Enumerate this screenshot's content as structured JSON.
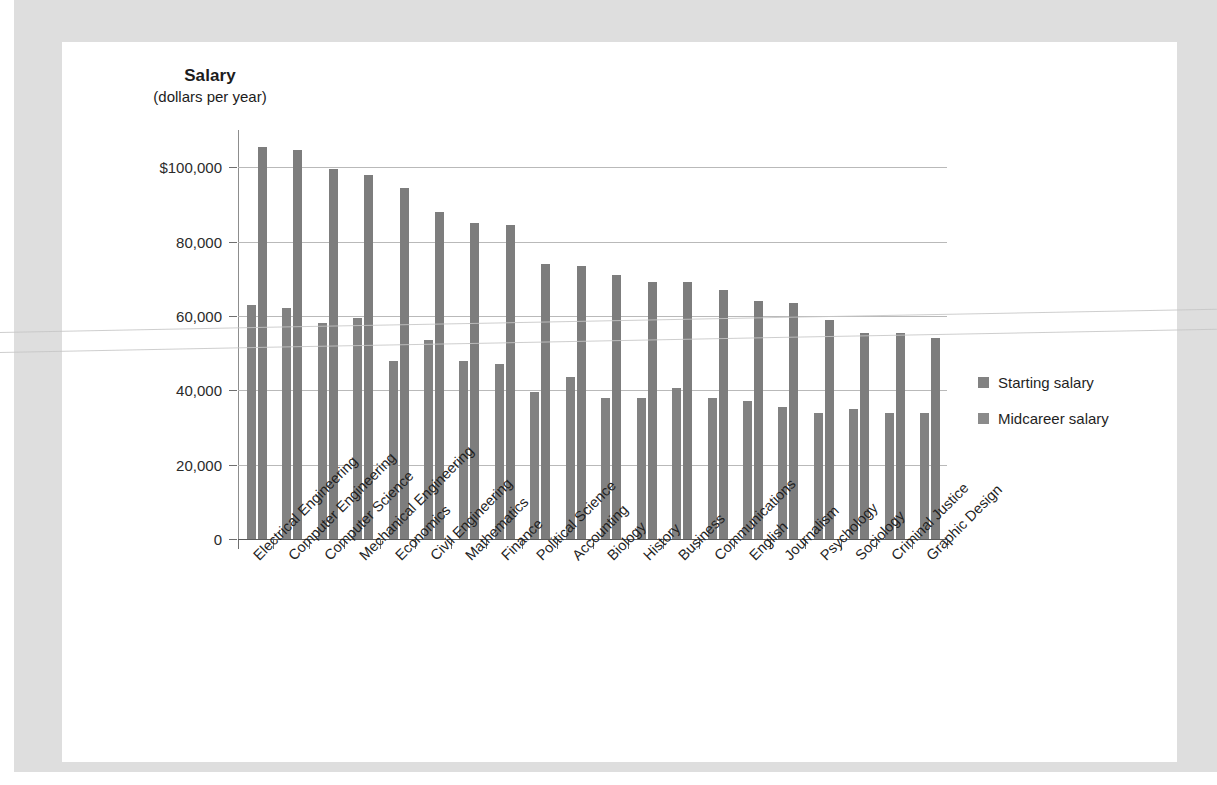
{
  "chart_data": {
    "type": "bar",
    "title": "Salary",
    "subtitle": "(dollars per year)",
    "xlabel": "",
    "ylabel": "Salary (dollars per year)",
    "ylim": [
      0,
      110000
    ],
    "grid": true,
    "legend_position": "right",
    "ytick_labels": [
      "$100,000",
      "80,000",
      "60,000",
      "40,000",
      "20,000",
      "0"
    ],
    "ytick_values": [
      100000,
      80000,
      60000,
      40000,
      20000,
      0
    ],
    "categories": [
      "Electrical Engineering",
      "Computer Engineering",
      "Computer Science",
      "Mechanical Engineering",
      "Economics",
      "Civil Engineering",
      "Mathematics",
      "Finance",
      "Political Science",
      "Accounting",
      "Biology",
      "History",
      "Business",
      "Communications",
      "English",
      "Journalism",
      "Psychology",
      "Sociology",
      "Criminal Justice",
      "Graphic Design"
    ],
    "series": [
      {
        "name": "Starting salary",
        "color": "#828282",
        "values": [
          63000,
          62000,
          58000,
          59500,
          48000,
          53500,
          48000,
          47000,
          39500,
          43500,
          38000,
          38000,
          40500,
          38000,
          37000,
          35500,
          34000,
          35000,
          34000,
          34000
        ]
      },
      {
        "name": "Midcareer salary",
        "color": "#7d7d7d",
        "values": [
          105500,
          104500,
          99500,
          98000,
          94500,
          88000,
          85000,
          84500,
          74000,
          73500,
          71000,
          69000,
          69000,
          67000,
          64000,
          63500,
          59000,
          55500,
          55500,
          54000
        ]
      }
    ]
  },
  "legend": {
    "items": [
      {
        "label": "Starting salary"
      },
      {
        "label": "Midcareer salary"
      }
    ]
  }
}
